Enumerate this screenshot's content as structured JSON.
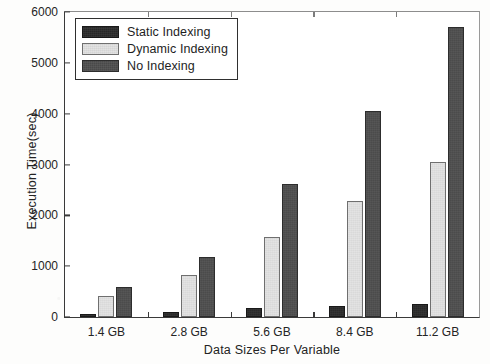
{
  "figure": {
    "background_color": "#fdfdfc",
    "plot_background_color": "#ffffff",
    "axis_color": "#3a3a3a"
  },
  "chart_data": {
    "type": "bar",
    "title": "",
    "subtitle": "",
    "xlabel": "Data Sizes Per Variable",
    "ylabel": "Execution Time(sec)",
    "categories": [
      "1.4 GB",
      "2.8 GB",
      "5.6 GB",
      "8.4 GB",
      "11.2 GB"
    ],
    "series": [
      {
        "name": "Static Indexing",
        "color": "#2b2b2b",
        "values": [
          50,
          95,
          170,
          220,
          255
        ]
      },
      {
        "name": "Dynamic Indexing",
        "color": "#e2e2e2",
        "values": [
          410,
          820,
          1580,
          2280,
          3050
        ]
      },
      {
        "name": "No Indexing",
        "color": "#4e4e4e",
        "values": [
          600,
          1190,
          2620,
          4060,
          5700
        ]
      }
    ],
    "ylim": [
      0,
      6000
    ],
    "yticks": [
      0,
      1000,
      2000,
      3000,
      4000,
      5000,
      6000
    ],
    "ytick_labels": [
      "0",
      "1000",
      "2000",
      "3000",
      "4000",
      "5000",
      "6000"
    ],
    "grid": false,
    "legend_position": "upper left",
    "legend_entries": [
      "Static Indexing",
      "Dynamic Indexing",
      "No Indexing"
    ]
  }
}
